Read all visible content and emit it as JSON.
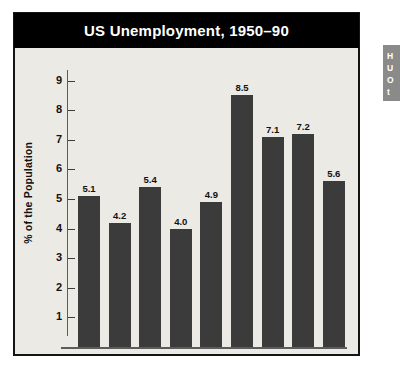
{
  "chart_data": {
    "type": "bar",
    "title": "US Unemployment, 1950–90",
    "xlabel": "",
    "ylabel": "% of the Population",
    "categories": [
      "1950",
      "1955",
      "1960",
      "1965",
      "1970",
      "1975",
      "1980",
      "1985",
      "1990"
    ],
    "values": [
      5.1,
      4.2,
      5.4,
      4.0,
      4.9,
      8.5,
      7.1,
      7.2,
      5.6
    ],
    "value_labels": [
      "5.1",
      "4.2",
      "5.4",
      "4.0",
      "4.9",
      "8.5",
      "7.1",
      "7.2",
      "5.6"
    ],
    "ylim": [
      0,
      9.6
    ],
    "yticks": [
      1,
      2,
      3,
      4,
      5,
      6,
      7,
      8,
      9
    ],
    "ytick_labels": [
      "1",
      "2",
      "3",
      "4",
      "5",
      "6",
      "7",
      "8",
      "9"
    ],
    "grid": false,
    "legend": null,
    "bar_color": "#3b3b3b",
    "plot_background": "#eceae5",
    "title_background": "#000000",
    "title_color": "#ffffff"
  },
  "side_panel": {
    "lines": [
      "H",
      "U",
      "O",
      "t"
    ]
  }
}
